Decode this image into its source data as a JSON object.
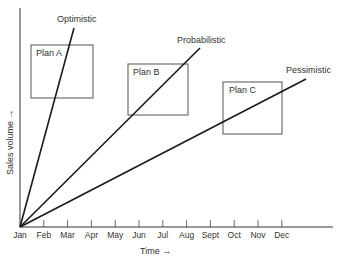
{
  "diagram": {
    "y_axis_label": "Sales volume →",
    "x_axis_label": "Time →",
    "months": [
      "Jan",
      "Feb",
      "Mar",
      "Apr",
      "May",
      "Jun",
      "Jul",
      "Aug",
      "Sept",
      "Oct",
      "Nov",
      "Dec"
    ],
    "forecast_lines": [
      {
        "name": "Optimistic"
      },
      {
        "name": "Probabilistic"
      },
      {
        "name": "Pessimistic"
      }
    ],
    "plans": [
      {
        "label": "Plan A"
      },
      {
        "label": "Plan B"
      },
      {
        "label": "Plan C"
      }
    ],
    "line_color": "#1a1a1a",
    "box_color": "#555555"
  }
}
